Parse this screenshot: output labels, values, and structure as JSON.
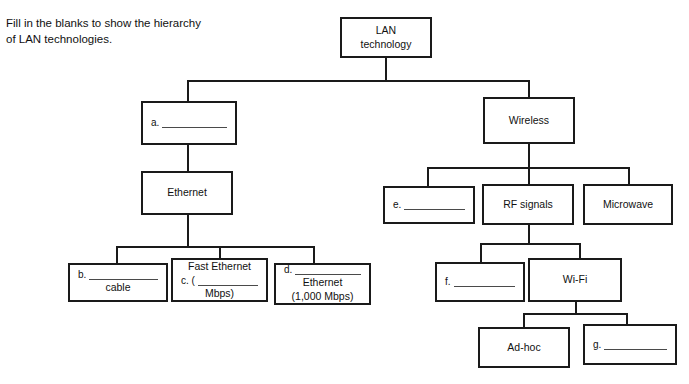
{
  "instructions": {
    "text": "Fill in the blanks to show the hierarchy\nof LAN technologies."
  },
  "diagram": {
    "nodes": {
      "root": {
        "label": "LAN\ntechnology"
      },
      "a": {
        "prefix": "a.",
        "label": ""
      },
      "ethernet": {
        "label": "Ethernet"
      },
      "b": {
        "prefix": "b.",
        "label": "",
        "subtext": "cable"
      },
      "c": {
        "toptext": "Fast Ethernet",
        "prefix": "c. (",
        "label": "",
        "subtext": "Mbps)"
      },
      "d": {
        "prefix": "d.",
        "label": "",
        "subtext": "Ethernet\n(1,000 Mbps)"
      },
      "wireless": {
        "label": "Wireless"
      },
      "e": {
        "prefix": "e.",
        "label": ""
      },
      "rf_signals": {
        "label": "RF signals"
      },
      "microwave": {
        "label": "Microwave"
      },
      "f": {
        "prefix": "f.",
        "label": ""
      },
      "wifi": {
        "label": "Wi-Fi"
      },
      "adhoc": {
        "label": "Ad-hoc"
      },
      "g": {
        "prefix": "g.",
        "label": ""
      }
    }
  }
}
